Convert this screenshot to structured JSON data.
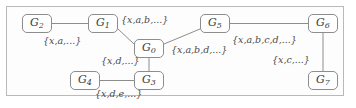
{
  "diagram": {
    "frame": {
      "visible": true,
      "border_color": "#b9b9b9"
    },
    "node_style": {
      "border_color": "#8d8d8d",
      "fill": "#ffffff",
      "text_color": "#3a3a3a"
    },
    "edge_style": {
      "color": "#8d8d8d"
    },
    "nodes": [
      {
        "id": "G2",
        "base": "G",
        "sub": "2",
        "x": 22,
        "y": 14,
        "w": 30,
        "h": 19
      },
      {
        "id": "G1",
        "base": "G",
        "sub": "1",
        "x": 88,
        "y": 14,
        "w": 30,
        "h": 19
      },
      {
        "id": "G5",
        "base": "G",
        "sub": "5",
        "x": 200,
        "y": 14,
        "w": 30,
        "h": 19
      },
      {
        "id": "G6",
        "base": "G",
        "sub": "6",
        "x": 308,
        "y": 14,
        "w": 30,
        "h": 19
      },
      {
        "id": "G0",
        "base": "G",
        "sub": "0",
        "x": 134,
        "y": 39,
        "w": 30,
        "h": 19
      },
      {
        "id": "G7",
        "base": "G",
        "sub": "7",
        "x": 308,
        "y": 71,
        "w": 30,
        "h": 19
      },
      {
        "id": "G4",
        "base": "G",
        "sub": "4",
        "x": 70,
        "y": 71,
        "w": 30,
        "h": 19
      },
      {
        "id": "G3",
        "base": "G",
        "sub": "3",
        "x": 134,
        "y": 71,
        "w": 30,
        "h": 19
      }
    ],
    "edges": [
      {
        "id": "e-g2-g1",
        "from": "G2",
        "to": "G1",
        "label": "{x,a,...}",
        "label_x": 43,
        "label_y": 36
      },
      {
        "id": "e-g1-g0",
        "from": "G1",
        "to": "G0",
        "label": "{x,a,b,...}",
        "label_x": 121,
        "label_y": 15
      },
      {
        "id": "e-g0-g5",
        "from": "G0",
        "to": "G5",
        "label": "{x,a,b,d,...}",
        "label_x": 171,
        "label_y": 45
      },
      {
        "id": "e-g5-g6",
        "from": "G5",
        "to": "G6",
        "label": "{x,a,b,c,d,...}",
        "label_x": 232,
        "label_y": 35
      },
      {
        "id": "e-g6-g7",
        "from": "G6",
        "to": "G7",
        "label": "{x,c,...}",
        "label_x": 272,
        "label_y": 55
      },
      {
        "id": "e-g0-g3",
        "from": "G0",
        "to": "G3",
        "label": "{x,d,...}",
        "label_x": 101,
        "label_y": 56
      },
      {
        "id": "e-g4-g3",
        "from": "G4",
        "to": "G3",
        "label": "{x,d,e,...}",
        "label_x": 95,
        "label_y": 89
      }
    ]
  }
}
